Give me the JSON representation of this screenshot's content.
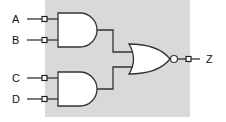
{
  "diagram": {
    "type": "logic-circuit",
    "inputs": [
      {
        "label": "A"
      },
      {
        "label": "B"
      },
      {
        "label": "C"
      },
      {
        "label": "D"
      }
    ],
    "gates": [
      {
        "type": "AND",
        "inputs": [
          "A",
          "B"
        ]
      },
      {
        "type": "AND",
        "inputs": [
          "C",
          "D"
        ]
      },
      {
        "type": "NOR",
        "inputs": [
          "AND1",
          "AND2"
        ]
      }
    ],
    "output": {
      "label": "Z"
    },
    "colors": {
      "background_panel": "#d9d9d9",
      "gate_fill": "#ffffff",
      "stroke": "#333333"
    }
  }
}
